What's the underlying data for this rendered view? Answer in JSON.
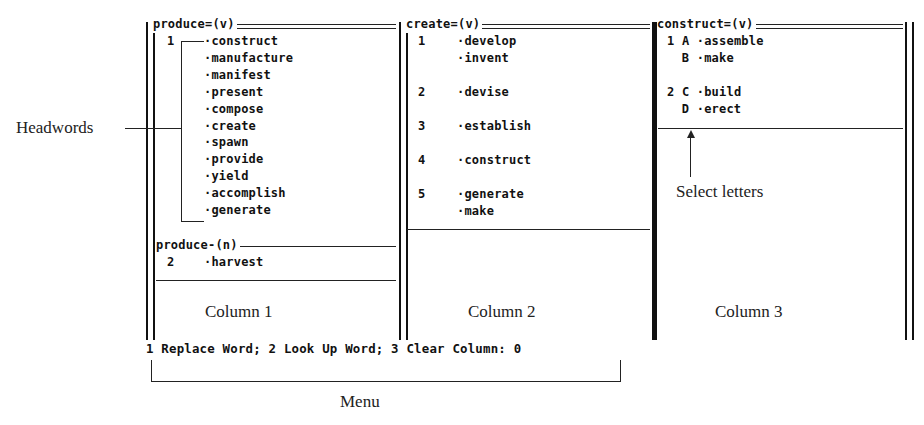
{
  "columns": [
    {
      "label": "Column 1",
      "sections": [
        {
          "heading": "produce=(v)",
          "senses": [
            {
              "num": "1",
              "words": [
                "construct",
                "manufacture",
                "manifest",
                "present",
                "compose",
                "create",
                "spawn",
                "provide",
                "yield",
                "accomplish",
                "generate"
              ]
            }
          ]
        },
        {
          "heading": "produce-(n)",
          "senses": [
            {
              "num": "2",
              "words": [
                "harvest"
              ]
            }
          ]
        }
      ]
    },
    {
      "label": "Column 2",
      "sections": [
        {
          "heading": "create=(v)",
          "senses": [
            {
              "num": "1",
              "words": [
                "develop",
                "invent"
              ]
            },
            {
              "num": "2",
              "words": [
                "devise"
              ]
            },
            {
              "num": "3",
              "words": [
                "establish"
              ]
            },
            {
              "num": "4",
              "words": [
                "construct"
              ]
            },
            {
              "num": "5",
              "words": [
                "generate",
                "make"
              ]
            }
          ]
        }
      ]
    },
    {
      "label": "Column 3",
      "sections": [
        {
          "heading": "construct=(v)",
          "senses": [
            {
              "num": "1",
              "entries": [
                {
                  "letter": "A",
                  "word": "assemble"
                },
                {
                  "letter": "B",
                  "word": "make"
                }
              ]
            },
            {
              "num": "2",
              "entries": [
                {
                  "letter": "C",
                  "word": "build"
                },
                {
                  "letter": "D",
                  "word": "erect"
                }
              ]
            }
          ]
        }
      ]
    }
  ],
  "menu": {
    "text": "1 Replace Word; 2 Look Up Word; 3 Clear Column: 0",
    "items": [
      {
        "key": "1",
        "label": "Replace Word"
      },
      {
        "key": "2",
        "label": "Look Up Word"
      },
      {
        "key": "3",
        "label": "Clear Column"
      }
    ],
    "current_value": "0"
  },
  "annotations": {
    "headwords": "Headwords",
    "select_letters": "Select letters",
    "menu": "Menu",
    "column1": "Column 1",
    "column2": "Column 2",
    "column3": "Column 3"
  },
  "bullet": "·"
}
